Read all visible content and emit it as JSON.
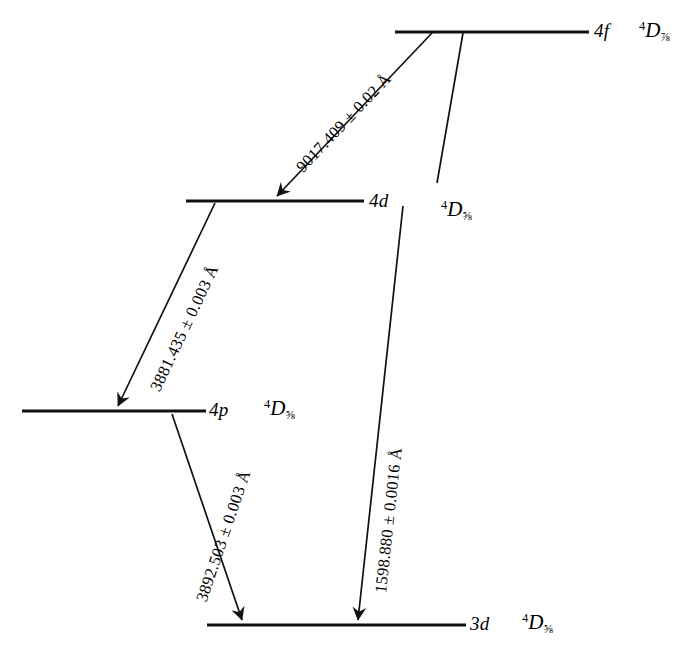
{
  "figure": {
    "kind": "energy-level-diagram",
    "background_color": "#ffffff",
    "ink_color": "#111111"
  },
  "levels": [
    {
      "id": "4f",
      "orbital": "4f",
      "term_multiplicity": "4",
      "term_symbol": "D",
      "term_j": "7/2",
      "term_j_glyph": "⅞"
    },
    {
      "id": "4d",
      "orbital": "4d",
      "term_multiplicity": "4",
      "term_symbol": "D",
      "term_j": "5/2",
      "term_j_glyph": "⅝"
    },
    {
      "id": "4p",
      "orbital": "4p",
      "term_multiplicity": "4",
      "term_symbol": "D",
      "term_j": "5/2",
      "term_j_glyph": "⅝"
    },
    {
      "id": "3d",
      "orbital": "3d",
      "term_multiplicity": "4",
      "term_symbol": "D",
      "term_j": "5/2",
      "term_j_glyph": "⅝"
    }
  ],
  "extra_terms": [
    {
      "id": "4f-secondary-term",
      "term_multiplicity": "4",
      "term_symbol": "D",
      "term_j": "5/2",
      "term_j_glyph": "⅝"
    }
  ],
  "transitions": [
    {
      "id": "4f-to-4d",
      "from": "4f",
      "to": "4d",
      "wavelength": "9017.409",
      "pm": "±",
      "uncertainty": "0.02",
      "unit": "Å",
      "label": "9017.409 ± 0.02 Å"
    },
    {
      "id": "4d-to-4p",
      "from": "4d",
      "to": "4p",
      "wavelength": "3881.435",
      "pm": "±",
      "uncertainty": "0.003",
      "unit": "Å",
      "label": "3881.435 ± 0.003 Å"
    },
    {
      "id": "4p-to-3d",
      "from": "4p",
      "to": "3d",
      "wavelength": "3892.503",
      "pm": "±",
      "uncertainty": "0.003",
      "unit": "Å",
      "label": "3892.503 ± 0.003 Å"
    },
    {
      "id": "4d-to-3d",
      "from": "4d",
      "to": "3d",
      "wavelength": "1598.880",
      "pm": "±",
      "uncertainty": "0.0016",
      "unit": "Å",
      "label": "1598.880 ± 0.0016 Å"
    }
  ]
}
